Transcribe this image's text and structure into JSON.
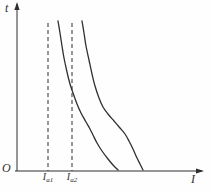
{
  "figure": {
    "background": "#fefefe",
    "line_color": "#2f2f2f"
  },
  "chart_data": {
    "type": "line",
    "title": "",
    "xlabel": "I",
    "ylabel": "t",
    "origin_label": "O",
    "grid": false,
    "legend": "none",
    "axis_tick_labels": [],
    "axes_px": {
      "origin": [
        17,
        171
      ],
      "y_axis_top": [
        17,
        4
      ],
      "x_axis_right": [
        202,
        171
      ]
    },
    "reference_lines": [
      {
        "label_base": "I",
        "label_sub": "a1",
        "x_px": 48,
        "y_top_px": 23,
        "style": "dashed"
      },
      {
        "label_base": "I",
        "label_sub": "a2",
        "x_px": 72,
        "y_top_px": 23,
        "style": "dashed"
      }
    ],
    "series": [
      {
        "name": "curve-1",
        "points_px": [
          [
            58,
            21
          ],
          [
            60,
            33
          ],
          [
            62,
            46
          ],
          [
            64,
            58
          ],
          [
            67,
            72
          ],
          [
            70,
            84
          ],
          [
            73,
            93
          ],
          [
            77,
            104
          ],
          [
            81,
            113
          ],
          [
            86,
            122
          ],
          [
            90,
            129
          ],
          [
            93,
            135
          ],
          [
            97,
            143
          ],
          [
            102,
            151
          ],
          [
            108,
            159
          ],
          [
            113,
            165
          ],
          [
            118,
            170
          ]
        ]
      },
      {
        "name": "curve-2",
        "points_px": [
          [
            82,
            21
          ],
          [
            84,
            33
          ],
          [
            86,
            46
          ],
          [
            89,
            60
          ],
          [
            92,
            74
          ],
          [
            95,
            86
          ],
          [
            99,
            98
          ],
          [
            103,
            107
          ],
          [
            108,
            114
          ],
          [
            114,
            121
          ],
          [
            120,
            128
          ],
          [
            125,
            134
          ],
          [
            129,
            141
          ],
          [
            133,
            149
          ],
          [
            137,
            158
          ],
          [
            140,
            164
          ],
          [
            143,
            170
          ]
        ]
      }
    ]
  }
}
